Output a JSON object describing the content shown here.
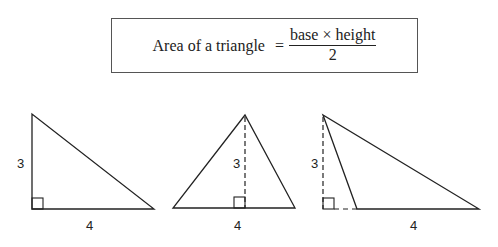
{
  "formula": {
    "lhs": "Area of a triangle",
    "equals": "=",
    "numerator": "base × height",
    "denominator": "2"
  },
  "triangles": [
    {
      "name": "right-triangle",
      "height_label": "3",
      "base_label": "4"
    },
    {
      "name": "acute-triangle",
      "height_label": "3",
      "base_label": "4"
    },
    {
      "name": "obtuse-triangle",
      "height_label": "3",
      "base_label": "4"
    }
  ],
  "colors": {
    "line": "#222222",
    "box_border": "#555555",
    "background": "#ffffff"
  }
}
